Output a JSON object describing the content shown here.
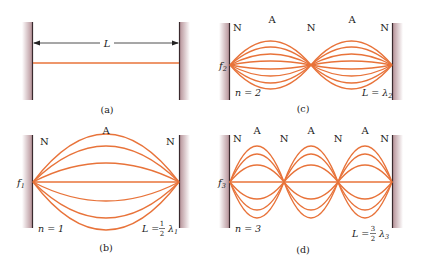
{
  "colors": {
    "string": "#e8733a",
    "wall_fill": "#c9a9ae",
    "wall_line": "#3a2a2e",
    "text": "#1a1a1a"
  },
  "panels": {
    "a": {
      "caption": "(a)",
      "length_label": "L"
    },
    "b": {
      "caption": "(b)",
      "node_left": "N",
      "node_right": "N",
      "antinode": "A",
      "freq": "f",
      "freq_sub": "1",
      "mode": "n = 1",
      "relation_left": "L =",
      "frac_num": "1",
      "frac_den": "2",
      "lambda": "λ",
      "lambda_sub": "1"
    },
    "c": {
      "caption": "(c)",
      "nodes": [
        "N",
        "N",
        "N"
      ],
      "antinodes": [
        "A",
        "A"
      ],
      "freq": "f",
      "freq_sub": "2",
      "mode": "n = 2",
      "relation": "L = λ",
      "lambda_sub": "2"
    },
    "d": {
      "caption": "(d)",
      "nodes": [
        "N",
        "N",
        "N",
        "N"
      ],
      "antinodes": [
        "A",
        "A",
        "A"
      ],
      "freq": "f",
      "freq_sub": "3",
      "mode": "n = 3",
      "relation_left": "L =",
      "frac_num": "3",
      "frac_den": "2",
      "lambda": "λ",
      "lambda_sub": "3"
    }
  }
}
